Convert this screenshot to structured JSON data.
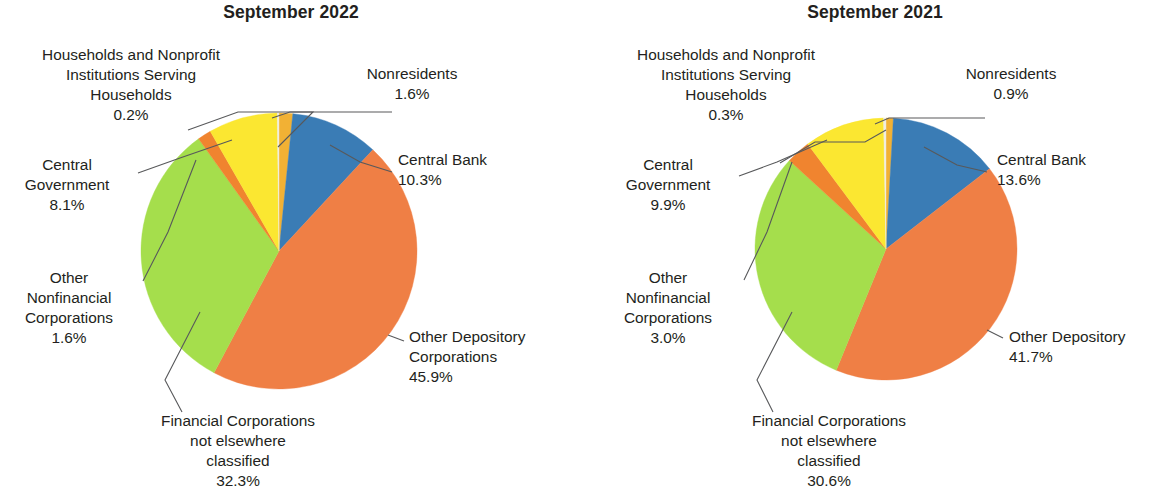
{
  "chart_data": [
    {
      "type": "pie",
      "title": "September 2022",
      "categories": [
        "Nonresidents",
        "Central Bank",
        "Other Depository Corporations",
        "Financial Corporations not elsewhere classified",
        "Other Nonfinancial Corporations",
        "Central Government",
        "Households and Nonprofit Institutions Serving Households"
      ],
      "values": [
        1.6,
        10.3,
        45.9,
        32.3,
        1.6,
        8.1,
        0.2
      ],
      "value_labels": [
        "1.6%",
        "10.3%",
        "45.9%",
        "32.3%",
        "1.6%",
        "8.1%",
        "0.2%"
      ],
      "colors": [
        "#f2b134",
        "#3a7cb5",
        "#ef7f45",
        "#a5de4c",
        "#f0842f",
        "#fbe731",
        "#f0ede0"
      ],
      "legend": "callouts",
      "start_angle_deg": 0,
      "direction": "clockwise",
      "grid": false,
      "xlabel": "",
      "ylabel": ""
    },
    {
      "type": "pie",
      "title": "September 2021",
      "categories": [
        "Nonresidents",
        "Central Bank",
        "Other Depository",
        "Financial Corporations not elsewhere classified",
        "Other Nonfinancial Corporations",
        "Central Government",
        "Households and Nonprofit Institutions Serving Households"
      ],
      "values": [
        0.9,
        13.6,
        41.7,
        30.6,
        3.0,
        9.9,
        0.3
      ],
      "value_labels": [
        "0.9%",
        "13.6%",
        "41.7%",
        "30.6%",
        "3.0%",
        "9.9%",
        "0.3%"
      ],
      "colors": [
        "#f2b134",
        "#3a7cb5",
        "#ef7f45",
        "#a5de4c",
        "#f0842f",
        "#fbe731",
        "#f0ede0"
      ],
      "legend": "callouts",
      "start_angle_deg": 0,
      "direction": "clockwise",
      "grid": false,
      "xlabel": "",
      "ylabel": ""
    }
  ],
  "left_chart": {
    "title": "September 2022",
    "labels": {
      "households": "Households and Nonprofit\nInstitutions Serving\nHouseholds\n0.2%",
      "nonresidents": "Nonresidents\n1.6%",
      "central_bank": "Central Bank\n10.3%",
      "central_government": "Central\nGovernment\n8.1%",
      "other_nonfinancial": "Other\nNonfinancial\nCorporations\n1.6%",
      "other_depository": "Other Depository\nCorporations\n45.9%",
      "financial_corporations": "Financial Corporations\nnot elsewhere\nclassified\n32.3%"
    }
  },
  "right_chart": {
    "title": "September 2021",
    "labels": {
      "households": "Households and Nonprofit\nInstitutions Serving\nHouseholds\n0.3%",
      "nonresidents": "Nonresidents\n0.9%",
      "central_bank": "Central Bank\n13.6%",
      "central_government": "Central\nGovernment\n9.9%",
      "other_nonfinancial": "Other\nNonfinancial\nCorporations\n3.0%",
      "other_depository": "Other Depository\n41.7%",
      "financial_corporations": "Financial Corporations\nnot elsewhere\nclassified\n30.6%"
    }
  }
}
